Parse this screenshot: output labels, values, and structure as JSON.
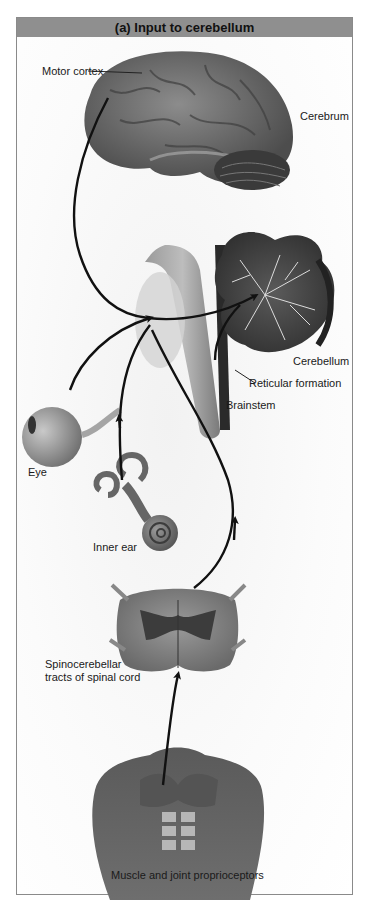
{
  "figure": {
    "title": "(a) Input to cerebellum",
    "labels": {
      "motor_cortex": "Motor cortex",
      "cerebrum": "Cerebrum",
      "cerebellum": "Cerebellum",
      "reticular_formation": "Reticular formation",
      "brainstem": "Brainstem",
      "eye": "Eye",
      "inner_ear": "Inner ear",
      "spinocerebellar_line1": "Spinocerebellar",
      "spinocerebellar_line2": "tracts of spinal cord",
      "proprioceptors": "Muscle and joint proprioceptors"
    },
    "colors": {
      "header_bg": "#8f8f8f",
      "frame_border": "#8a8a8a",
      "arrow": "#111111",
      "tissue_dark": "#4a4a4a",
      "tissue_mid": "#7a7a7a"
    }
  }
}
